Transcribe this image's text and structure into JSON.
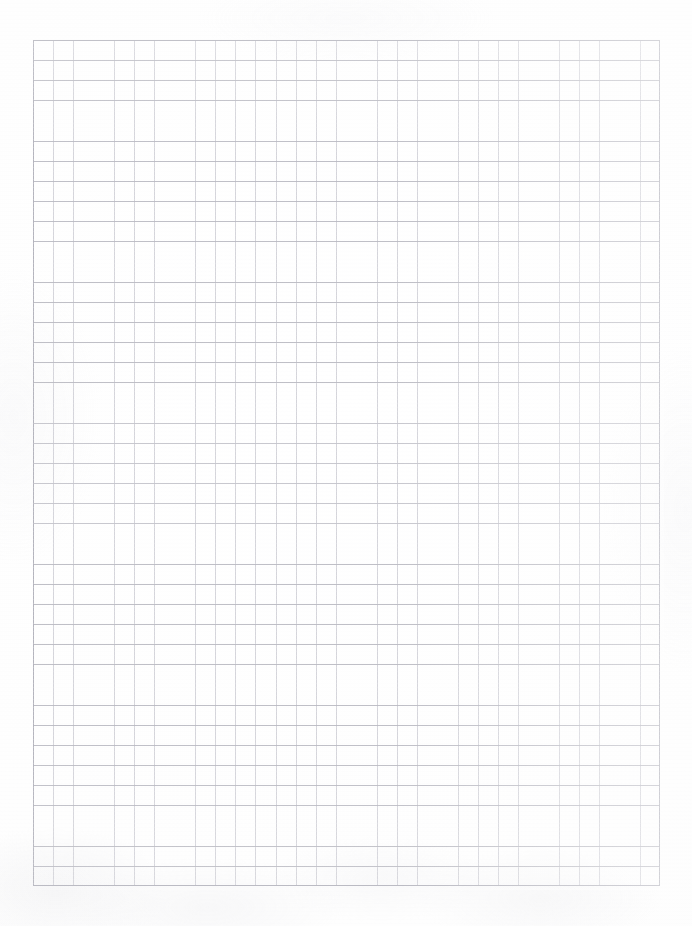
{
  "document": {
    "kind": "scanned-graph-paper",
    "title": "",
    "visible_text": "",
    "page_width": 692,
    "page_height": 926
  },
  "paper": {
    "background_color": "#ffffff",
    "tone_color": "#fdfdfd",
    "texture_color": "#e8e8ec"
  },
  "grid": {
    "left": 33,
    "top": 40,
    "width": 627,
    "height": 846,
    "cell_size": 20.2,
    "columns": 31,
    "rows": 42,
    "vertical_line_color": "#cdcdd4",
    "horizontal_line_color": "#babac2",
    "border_color": "#b4b4bd"
  },
  "annotations": {
    "marks": [],
    "note": ""
  }
}
